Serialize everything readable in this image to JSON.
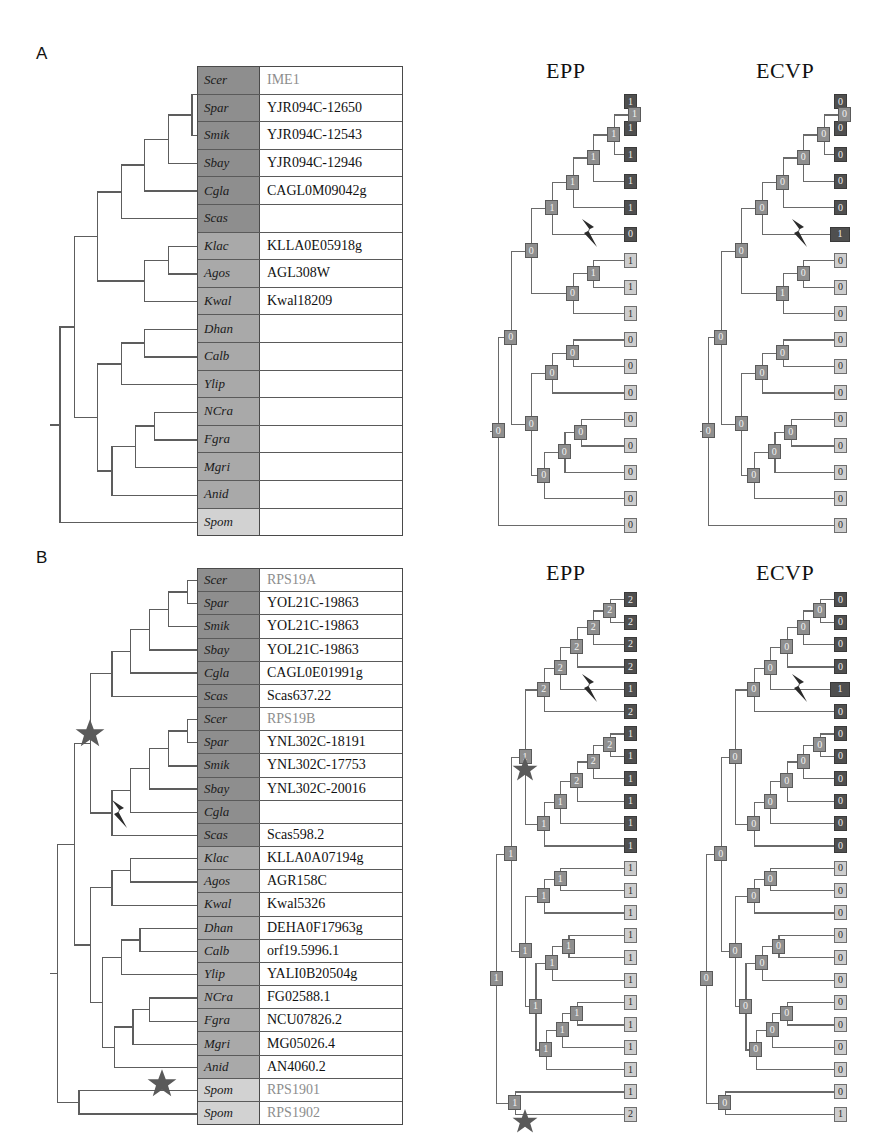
{
  "figure": {
    "panels": [
      {
        "letter": "A",
        "tree_titles": [
          "EPP",
          "ECVP"
        ]
      },
      {
        "letter": "B",
        "tree_titles": [
          "EPP",
          "ECVP"
        ]
      }
    ]
  },
  "panelA": {
    "letter": "A",
    "epp_title": "EPP",
    "ecvp_title": "ECVP",
    "rows": [
      {
        "species": "Scer",
        "gene": "IME1",
        "shade": "dark",
        "faded": true
      },
      {
        "species": "Spar",
        "gene": "YJR094C-12650",
        "shade": "dark",
        "faded": false
      },
      {
        "species": "Smik",
        "gene": "YJR094C-12543",
        "shade": "dark",
        "faded": false
      },
      {
        "species": "Sbay",
        "gene": "YJR094C-12946",
        "shade": "dark",
        "faded": false
      },
      {
        "species": "Cgla",
        "gene": "CAGL0M09042g",
        "shade": "dark",
        "faded": false
      },
      {
        "species": "Scas",
        "gene": "",
        "shade": "dark",
        "faded": false
      },
      {
        "species": "Klac",
        "gene": "KLLA0E05918g",
        "shade": "mid",
        "faded": false
      },
      {
        "species": "Agos",
        "gene": "AGL308W",
        "shade": "mid",
        "faded": false
      },
      {
        "species": "Kwal",
        "gene": "Kwal18209",
        "shade": "mid",
        "faded": false
      },
      {
        "species": "Dhan",
        "gene": "",
        "shade": "mid",
        "faded": false
      },
      {
        "species": "Calb",
        "gene": "",
        "shade": "mid",
        "faded": false
      },
      {
        "species": "Ylip",
        "gene": "",
        "shade": "mid",
        "faded": false
      },
      {
        "species": "NCra",
        "gene": "",
        "shade": "mid",
        "faded": false
      },
      {
        "species": "Fgra",
        "gene": "",
        "shade": "mid",
        "faded": false
      },
      {
        "species": "Mgri",
        "gene": "",
        "shade": "mid",
        "faded": false
      },
      {
        "species": "Anid",
        "gene": "",
        "shade": "mid",
        "faded": false
      },
      {
        "species": "Spom",
        "gene": "",
        "shade": "light",
        "faded": false
      }
    ],
    "epp_leaf_states": [
      "1",
      "1",
      "1",
      "1",
      "1",
      "0",
      "1",
      "1",
      "1",
      "0",
      "0",
      "0",
      "0",
      "0",
      "0",
      "0",
      "0"
    ],
    "ecvp_leaf_states": [
      "0",
      "0",
      "0",
      "0",
      "0",
      "1",
      "0",
      "0",
      "0",
      "0",
      "0",
      "0",
      "0",
      "0",
      "0",
      "0",
      "0"
    ],
    "epp_internal_states": [
      "1",
      "1",
      "1",
      "1",
      "1",
      "1",
      "0",
      "0",
      "0",
      "0",
      "0",
      "0",
      "0",
      "0",
      "0",
      "0"
    ],
    "ecvp_internal_states": [
      "0",
      "0",
      "0",
      "0",
      "0",
      "0",
      "1",
      "0",
      "0",
      "0",
      "0",
      "0",
      "0",
      "0",
      "0",
      "0"
    ]
  },
  "panelB": {
    "letter": "B",
    "epp_title": "EPP",
    "ecvp_title": "ECVP",
    "rows": [
      {
        "species": "Scer",
        "gene": "RPS19A",
        "shade": "dark",
        "faded": true
      },
      {
        "species": "Spar",
        "gene": "YOL21C-19863",
        "shade": "dark",
        "faded": false
      },
      {
        "species": "Smik",
        "gene": "YOL21C-19863",
        "shade": "dark",
        "faded": false
      },
      {
        "species": "Sbay",
        "gene": "YOL21C-19863",
        "shade": "dark",
        "faded": false
      },
      {
        "species": "Cgla",
        "gene": "CAGL0E01991g",
        "shade": "dark",
        "faded": false
      },
      {
        "species": "Scas",
        "gene": "Scas637.22",
        "shade": "dark",
        "faded": false
      },
      {
        "species": "Scer",
        "gene": "RPS19B",
        "shade": "dark",
        "faded": true
      },
      {
        "species": "Spar",
        "gene": "YNL302C-18191",
        "shade": "dark",
        "faded": false
      },
      {
        "species": "Smik",
        "gene": "YNL302C-17753",
        "shade": "dark",
        "faded": false
      },
      {
        "species": "Sbay",
        "gene": "YNL302C-20016",
        "shade": "dark",
        "faded": false
      },
      {
        "species": "Cgla",
        "gene": "",
        "shade": "dark",
        "faded": false
      },
      {
        "species": "Scas",
        "gene": "Scas598.2",
        "shade": "dark",
        "faded": false
      },
      {
        "species": "Klac",
        "gene": "KLLA0A07194g",
        "shade": "mid",
        "faded": false
      },
      {
        "species": "Agos",
        "gene": "AGR158C",
        "shade": "mid",
        "faded": false
      },
      {
        "species": "Kwal",
        "gene": "Kwal5326",
        "shade": "mid",
        "faded": false
      },
      {
        "species": "Dhan",
        "gene": "DEHA0F17963g",
        "shade": "mid",
        "faded": false
      },
      {
        "species": "Calb",
        "gene": "orf19.5996.1",
        "shade": "mid",
        "faded": false
      },
      {
        "species": "Ylip",
        "gene": "YALI0B20504g",
        "shade": "mid",
        "faded": false
      },
      {
        "species": "NCra",
        "gene": "FG02588.1",
        "shade": "mid",
        "faded": false
      },
      {
        "species": "Fgra",
        "gene": "NCU07826.2",
        "shade": "mid",
        "faded": false
      },
      {
        "species": "Mgri",
        "gene": "MG05026.4",
        "shade": "mid",
        "faded": false
      },
      {
        "species": "Anid",
        "gene": "AN4060.2",
        "shade": "mid",
        "faded": false
      },
      {
        "species": "Spom",
        "gene": "RPS1901",
        "shade": "light",
        "faded": true
      },
      {
        "species": "Spom",
        "gene": "RPS1902",
        "shade": "light",
        "faded": true
      }
    ],
    "epp_leaf_states": [
      "2",
      "2",
      "2",
      "2",
      "1",
      "2",
      "1",
      "1",
      "1",
      "1",
      "1",
      "1",
      "1",
      "1",
      "1",
      "1",
      "1",
      "1",
      "1",
      "1",
      "1",
      "1",
      "1",
      "2"
    ],
    "ecvp_leaf_states": [
      "0",
      "0",
      "0",
      "0",
      "1",
      "0",
      "0",
      "0",
      "0",
      "0",
      "0",
      "0",
      "0",
      "0",
      "0",
      "0",
      "0",
      "0",
      "0",
      "0",
      "0",
      "0",
      "0",
      "1"
    ],
    "epp_internal_states": [
      "2",
      "2",
      "2",
      "2",
      "2",
      "2",
      "2",
      "2",
      "1",
      "1",
      "1",
      "1",
      "1",
      "1",
      "1",
      "1",
      "1",
      "1",
      "1",
      "1",
      "1",
      "1",
      "1"
    ],
    "ecvp_internal_states": [
      "0",
      "0",
      "0",
      "0",
      "0",
      "0",
      "0",
      "0",
      "0",
      "0",
      "0",
      "0",
      "0",
      "0",
      "0",
      "0",
      "0",
      "0",
      "0",
      "0",
      "0",
      "0",
      "0"
    ]
  },
  "glyphs": {
    "bolt_name": "lightning-bolt-icon",
    "star_name": "star-icon",
    "bolt_char": "⚡",
    "star_char": "★"
  },
  "colors": {
    "shade_dark": "#8e8e8e",
    "shade_mid": "#a9a9a9",
    "shade_light": "#d2d2d2",
    "node_dark": "#4f4f4f",
    "node_mid": "#8f8f8f",
    "node_light": "#cdcdcd",
    "line": "#5d5d5d"
  }
}
